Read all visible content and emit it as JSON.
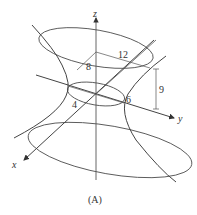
{
  "figure": {
    "caption": "(A)",
    "axes": {
      "x_label": "x",
      "y_label": "y",
      "z_label": "z"
    },
    "dimensions": {
      "top_semi_axis_x": "8",
      "top_semi_axis_y": "12",
      "height_to_top": "9",
      "waist_semi_axis_y": "6",
      "waist_semi_axis_x": "4"
    },
    "colors": {
      "stroke": "#555555",
      "text": "#333333",
      "background": "#ffffff"
    }
  }
}
